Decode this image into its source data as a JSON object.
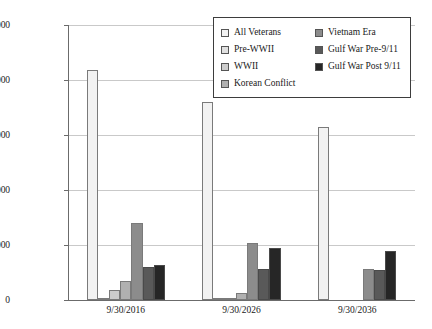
{
  "chart_data": {
    "type": "bar",
    "title": "",
    "subtitle": "",
    "xlabel": "",
    "ylabel": "",
    "categories": [
      "9/30/2016",
      "9/30/2026",
      "9/30/2036"
    ],
    "ylim": [
      0,
      25000000
    ],
    "ytick_values": [
      0,
      5000000,
      10000000,
      15000000,
      20000000,
      25000000
    ],
    "ytick_labels": [
      "0",
      "5,000,000",
      "10,000,000",
      "15,000,000",
      "20,000,000",
      "25,000,000"
    ],
    "grid": true,
    "legend_position": "top-right",
    "series": [
      {
        "name": "All Veterans",
        "color": "#f2f2f2",
        "values": [
          20900000,
          18000000,
          15700000
        ]
      },
      {
        "name": "Pre-WWII",
        "color": "#e0e0e0",
        "values": [
          120000,
          30000,
          0
        ]
      },
      {
        "name": "WWII",
        "color": "#cccccc",
        "values": [
          900000,
          120000,
          0
        ]
      },
      {
        "name": "Korean Conflict",
        "color": "#b0b0b0",
        "values": [
          1700000,
          620000,
          0
        ]
      },
      {
        "name": "Vietnam Era",
        "color": "#8c8c8c",
        "values": [
          7000000,
          5200000,
          2800000
        ]
      },
      {
        "name": "Gulf War Pre-9/11",
        "color": "#595959",
        "values": [
          3000000,
          2800000,
          2700000
        ]
      },
      {
        "name": "Gulf War Post 9/11",
        "color": "#262626",
        "values": [
          3200000,
          4700000,
          4500000
        ]
      }
    ]
  },
  "legend": {
    "entries": [
      {
        "label": "All Veterans",
        "swatch": "#f2f2f2"
      },
      {
        "label": "Vietnam Era",
        "swatch": "#8c8c8c"
      },
      {
        "label": "Pre-WWII",
        "swatch": "#e0e0e0"
      },
      {
        "label": "Gulf War Pre-9/11",
        "swatch": "#595959"
      },
      {
        "label": "WWII",
        "swatch": "#cccccc"
      },
      {
        "label": "Gulf War Post 9/11",
        "swatch": "#262626"
      },
      {
        "label": "Korean Conflict",
        "swatch": "#b0b0b0"
      }
    ]
  }
}
